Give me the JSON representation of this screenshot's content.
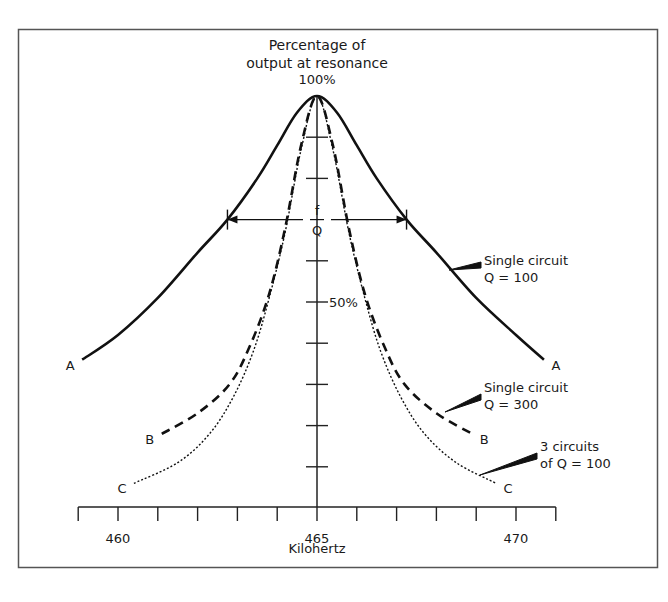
{
  "chart_data": {
    "type": "line",
    "title": "Percentage of output at resonance",
    "title_lines": [
      "Percentage of",
      "output at resonance"
    ],
    "xlabel": "Kilohertz",
    "ylabel": "Percentage of output at resonance",
    "xlim": [
      459,
      471
    ],
    "ylim": [
      0,
      100
    ],
    "x_ticks": [
      459,
      460,
      461,
      462,
      463,
      464,
      465,
      466,
      467,
      468,
      469,
      470,
      471
    ],
    "x_tick_labels": [
      {
        "x": 460,
        "label": "460"
      },
      {
        "x": 465,
        "label": "465"
      },
      {
        "x": 470,
        "label": "470"
      }
    ],
    "y_ticks": [
      10,
      20,
      30,
      40,
      50,
      60,
      70,
      80,
      90,
      100
    ],
    "y_tick_labels": [
      {
        "y": 100,
        "label": "100%"
      },
      {
        "y": 50,
        "label": "50%"
      }
    ],
    "center_frequency": 465,
    "bandwidth_marker": {
      "label_num": "f",
      "label_den": "Q",
      "y": 70,
      "x_from": 462.75,
      "x_to": 467.25
    },
    "grid": false,
    "legend": "annotations",
    "series": [
      {
        "name": "Single circuit Q = 100",
        "label_lines": [
          "Single circuit",
          "Q = 100"
        ],
        "end_label": "A",
        "style": "solid",
        "x": [
          459.1,
          460,
          461,
          462,
          462.75,
          463.5,
          464,
          464.5,
          465,
          465.5,
          466,
          466.5,
          467.25,
          468,
          469,
          470,
          470.7
        ],
        "y": [
          36,
          42,
          51,
          62,
          70,
          80,
          88,
          96,
          100,
          96,
          88,
          80,
          70,
          62,
          51,
          42,
          36
        ]
      },
      {
        "name": "Single circuit Q = 300",
        "label_lines": [
          "Single circuit",
          "Q = 300"
        ],
        "end_label": "B",
        "style": "dashed",
        "x": [
          461.1,
          462,
          462.8,
          463.3,
          463.8,
          464.2,
          464.6,
          465,
          465.4,
          465.8,
          466.2,
          466.7,
          467.2,
          468,
          468.9
        ],
        "y": [
          18,
          23,
          30,
          39,
          52,
          68,
          88,
          100,
          88,
          68,
          52,
          39,
          30,
          23,
          18
        ]
      },
      {
        "name": "3 circuits of Q = 100",
        "label_lines": [
          "3 circuits",
          "of Q = 100"
        ],
        "end_label": "C",
        "style": "dotted",
        "x": [
          460.4,
          461.5,
          462.3,
          462.9,
          463.4,
          463.8,
          464.2,
          464.6,
          465,
          465.4,
          465.8,
          466.2,
          466.6,
          467.1,
          467.7,
          468.5,
          469.5
        ],
        "y": [
          6,
          11,
          18,
          27,
          38,
          51,
          67,
          87,
          100,
          87,
          67,
          51,
          38,
          27,
          18,
          11,
          6
        ]
      }
    ]
  }
}
